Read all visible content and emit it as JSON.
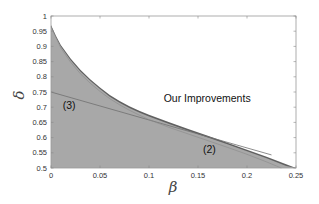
{
  "chart_data": {
    "type": "area",
    "title": "",
    "xlabel": "β",
    "ylabel": "δ",
    "xlim": [
      0,
      0.25
    ],
    "ylim": [
      0.5,
      1
    ],
    "xticks": [
      "0",
      "0.05",
      "0.1",
      "0.15",
      "0.2",
      "0.25"
    ],
    "yticks": [
      "0.5",
      "0.55",
      "0.6",
      "0.65",
      "0.7",
      "0.75",
      "0.8",
      "0.85",
      "0.9",
      "0.95",
      "1"
    ],
    "grid": false,
    "legend": null,
    "series": [
      {
        "name": "Our Improvements (upper boundary)",
        "x": [
          0,
          0.005,
          0.01,
          0.02,
          0.03,
          0.04,
          0.05,
          0.06,
          0.07,
          0.08,
          0.09,
          0.1,
          0.12,
          0.14,
          0.16,
          0.18,
          0.2,
          0.22,
          0.24,
          0.25
        ],
        "y": [
          0.97,
          0.935,
          0.905,
          0.86,
          0.823,
          0.792,
          0.765,
          0.74,
          0.72,
          0.703,
          0.688,
          0.675,
          0.651,
          0.628,
          0.606,
          0.583,
          0.56,
          0.537,
          0.512,
          0.5
        ]
      },
      {
        "name": "(2)",
        "x": [
          0,
          0.01,
          0.02,
          0.03,
          0.04,
          0.05,
          0.06,
          0.07,
          0.08,
          0.09,
          0.1,
          0.12,
          0.14,
          0.16,
          0.18,
          0.2,
          0.22,
          0.235
        ],
        "y": [
          0.965,
          0.895,
          0.848,
          0.81,
          0.779,
          0.752,
          0.728,
          0.708,
          0.69,
          0.674,
          0.659,
          0.634,
          0.612,
          0.59,
          0.568,
          0.545,
          0.52,
          0.5
        ]
      },
      {
        "name": "(3)",
        "x": [
          0,
          0.05,
          0.1,
          0.15,
          0.2,
          0.225
        ],
        "y": [
          0.75,
          0.704,
          0.658,
          0.612,
          0.566,
          0.543
        ]
      }
    ],
    "annotations": [
      {
        "text": "Our Improvements",
        "x": 0.115,
        "y": 0.716
      },
      {
        "text": "(3)",
        "x": 0.012,
        "y": 0.695
      },
      {
        "text": "(2)",
        "x": 0.155,
        "y": 0.548
      }
    ],
    "colors": {
      "region_fill": "#a8a8a8",
      "improvement_band": "#606060",
      "line3": "#707070",
      "axis": "#888888"
    }
  }
}
